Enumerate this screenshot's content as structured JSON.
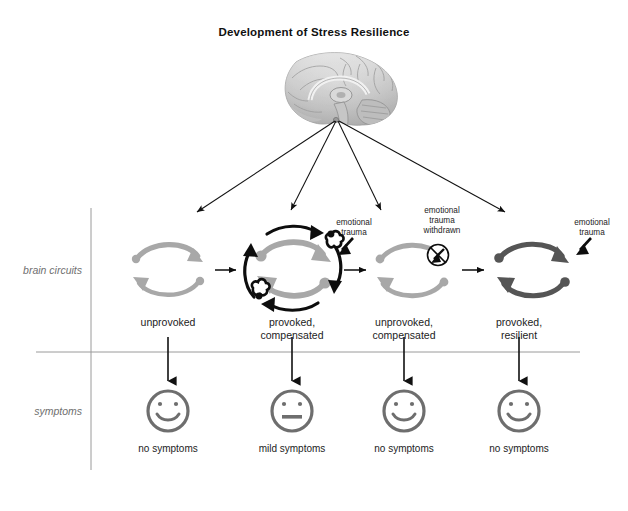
{
  "figure": {
    "title": "Development of Stress Resilience",
    "row_labels": {
      "circuits": "brain circuits",
      "symptoms": "symptoms"
    },
    "brain": {
      "icon": "brain-sagittal-illustration",
      "fan_arrow_count": 4
    },
    "stages": [
      {
        "id": "unprovoked",
        "circuit_label": "unprovoked",
        "circuit_style": "light-gray-loop",
        "annotation": "",
        "annotation_icon": "",
        "symptom_label": "no symptoms",
        "face": "smile"
      },
      {
        "id": "provoked-compensated",
        "circuit_label": "provoked,\ncompensated",
        "circuit_label_line1": "provoked,",
        "circuit_label_line2": "compensated",
        "circuit_style": "gray-loop-with-black-compensatory-arrows",
        "annotation": "emotional\ntrauma",
        "annotation_line1": "emotional",
        "annotation_line2": "trauma",
        "annotation_icon": "trauma-arrow-icon",
        "symptom_label": "mild symptoms",
        "face": "neutral"
      },
      {
        "id": "unprovoked-compensated",
        "circuit_label": "unprovoked,\ncompensated",
        "circuit_label_line1": "unprovoked,",
        "circuit_label_line2": "compensated",
        "circuit_style": "light-gray-loop",
        "annotation": "emotional\ntrauma\nwithdrawn",
        "annotation_line1": "emotional",
        "annotation_line2": "trauma",
        "annotation_line3": "withdrawn",
        "annotation_icon": "trauma-withdrawn-negated-arrow-icon",
        "symptom_label": "no symptoms",
        "face": "smile"
      },
      {
        "id": "provoked-resilient",
        "circuit_label": "provoked,\nresilient",
        "circuit_label_line1": "provoked,",
        "circuit_label_line2": "resilient",
        "circuit_style": "dark-gray-loop",
        "annotation": "emotional\ntrauma",
        "annotation_line1": "emotional",
        "annotation_line2": "trauma",
        "annotation_icon": "trauma-arrow-icon",
        "symptom_label": "no symptoms",
        "face": "smile"
      }
    ],
    "colors": {
      "loop_light": "#a8a8a8",
      "loop_dark": "#555555",
      "compensatory": "#0d0d0d",
      "face": "#6e6e6e",
      "divider": "#9a9a9a",
      "arrow": "#111111",
      "text": "#1c1c1c",
      "row_label": "#6f6f6f"
    }
  }
}
